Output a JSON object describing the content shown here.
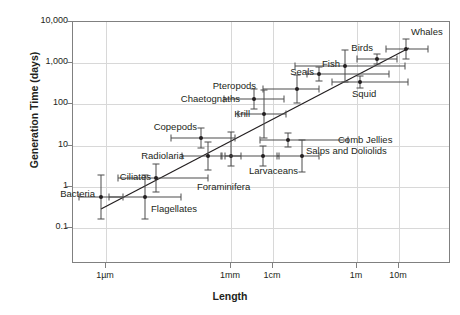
{
  "chart_data": {
    "type": "scatter",
    "title": "",
    "xlabel": "Length",
    "ylabel": "Generation Time (days)",
    "x_tick_labels": [
      "1µm",
      "1mm",
      "1cm",
      "1m",
      "10m"
    ],
    "y_tick_labels": [
      "10,000",
      "1,000",
      "100",
      "10",
      "1",
      "0.1"
    ],
    "xscale": "log",
    "yscale": "log",
    "grid": true,
    "legend": "none",
    "trendline": {
      "present": true,
      "style": "solid straight line",
      "note": "positive log-log relationship between body length and generation time"
    },
    "points": [
      {
        "label": "Bacteria",
        "x_px": 100,
        "y_px": 196,
        "y_value": 0.35,
        "label_side": "left",
        "lx": 94,
        "ly": 193
      },
      {
        "label": "Flagellates",
        "x_px": 144,
        "y_px": 196,
        "y_value": 0.35,
        "label_side": "right",
        "lx": 150,
        "ly": 208
      },
      {
        "label": "Ciliates",
        "x_px": 155,
        "y_px": 177,
        "y_value": 1.0,
        "label_side": "left",
        "lx": 150,
        "ly": 176
      },
      {
        "label": "Radiolaria",
        "x_px": 207,
        "y_px": 155,
        "y_value": 5.5,
        "label_side": "left",
        "lx": 183,
        "ly": 155
      },
      {
        "label": "Foraminifera",
        "x_px": 230,
        "y_px": 155,
        "y_value": 5.5,
        "label_side": "right",
        "lx": 196,
        "ly": 186
      },
      {
        "label": "Copepods",
        "x_px": 200,
        "y_px": 137,
        "y_value": 19,
        "label_side": "left",
        "lx": 196,
        "ly": 126
      },
      {
        "label": "Larvaceans",
        "x_px": 262,
        "y_px": 155,
        "y_value": 5.5,
        "label_side": "right",
        "lx": 248,
        "ly": 170
      },
      {
        "label": "Salps and Doliolids",
        "x_px": 301,
        "y_px": 155,
        "y_value": 5.5,
        "label_side": "right",
        "lx": 305,
        "ly": 150
      },
      {
        "label": "Comb Jellies",
        "x_px": 287,
        "y_px": 139,
        "y_value": 16,
        "label_side": "right",
        "lx": 337,
        "ly": 139
      },
      {
        "label": "Krill",
        "x_px": 263,
        "y_px": 113,
        "y_value": 95,
        "label_side": "left",
        "lx": 249,
        "ly": 113
      },
      {
        "label": "Chaetognaths",
        "x_px": 253,
        "y_px": 98,
        "y_value": 210,
        "label_side": "left",
        "lx": 239,
        "ly": 98
      },
      {
        "label": "Pteropods",
        "x_px": 296,
        "y_px": 88,
        "y_value": 300,
        "label_side": "left",
        "lx": 255,
        "ly": 85
      },
      {
        "label": "Seals",
        "x_px": 318,
        "y_px": 73,
        "y_value": 700,
        "label_side": "left",
        "lx": 313,
        "ly": 71
      },
      {
        "label": "Fish",
        "x_px": 344,
        "y_px": 65,
        "y_value": 1100,
        "label_side": "left",
        "lx": 339,
        "ly": 63
      },
      {
        "label": "Squid",
        "x_px": 359,
        "y_px": 81,
        "y_value": 430,
        "label_side": "right",
        "lx": 351,
        "ly": 93
      },
      {
        "label": "Birds",
        "x_px": 376,
        "y_px": 58,
        "y_value": 1500,
        "label_side": "left",
        "lx": 372,
        "ly": 47
      },
      {
        "label": "Whales",
        "x_px": 405,
        "y_px": 48,
        "y_value": 2400,
        "label_side": "right",
        "lx": 410,
        "ly": 31
      }
    ]
  },
  "axes": {
    "y_ticks": [
      {
        "label": "10,000",
        "y": 21
      },
      {
        "label": "1,000",
        "y": 62
      },
      {
        "label": "100",
        "y": 103
      },
      {
        "label": "10",
        "y": 145
      },
      {
        "label": "1",
        "y": 186
      },
      {
        "label": "0.1",
        "y": 227
      }
    ],
    "x_ticks": [
      {
        "label": "1µm",
        "x": 105
      },
      {
        "label": "1mm",
        "x": 230
      },
      {
        "label": "1cm",
        "x": 272
      },
      {
        "label": "1m",
        "x": 356
      },
      {
        "label": "10m",
        "x": 398
      }
    ],
    "x_axis_title": "Length",
    "y_axis_title": "Generation Time (days)"
  },
  "colors": {
    "marker": "#231f20",
    "grid": "#d8d8d8",
    "frame": "#808080",
    "errorbar": "#4d4d4d",
    "background": "#ffffff"
  }
}
